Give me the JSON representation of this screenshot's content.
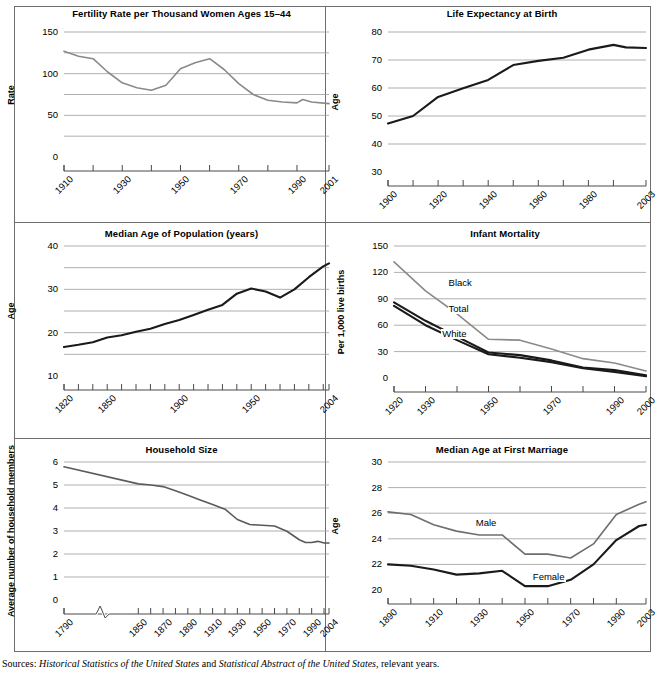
{
  "footer": {
    "prefix": "Sources: ",
    "source1": "Historical Statistics of the United States",
    "conjunction": " and ",
    "source2": "Statistical Abstract of the United States",
    "suffix": ", relevant years."
  },
  "colors": {
    "gray_line": "#8a8a8a",
    "black_line": "#1a1a1a",
    "gridline": "#9a9a9a",
    "axis": "#4a4a4a",
    "frame": "#6e6e6e",
    "text": "#000000",
    "background": "#ffffff"
  },
  "chart_data": [
    {
      "id": "fertility-rate",
      "type": "line",
      "title": "Fertility Rate per Thousand Women Ages 15–44",
      "xlabel": "",
      "ylabel": "Rate",
      "ylim": [
        0,
        150
      ],
      "yticks": [
        0,
        50,
        100,
        150
      ],
      "yticklabels": [
        "0",
        "50",
        "100",
        "150"
      ],
      "minor_gridlines": [
        25,
        75,
        125
      ],
      "grid": true,
      "xlim": [
        1910,
        2001
      ],
      "xticks": [
        1910,
        1920,
        1930,
        1940,
        1950,
        1960,
        1970,
        1980,
        1990,
        2001
      ],
      "xticklabels": [
        "1910",
        "",
        "1930",
        "",
        "1950",
        "",
        "1970",
        "",
        "1990",
        "2001"
      ],
      "legend": "none",
      "series": [
        {
          "name": "Fertility rate",
          "color": "#8a8a8a",
          "x": [
            1910,
            1915,
            1920,
            1925,
            1930,
            1935,
            1940,
            1945,
            1950,
            1955,
            1960,
            1965,
            1970,
            1975,
            1980,
            1985,
            1990,
            1992,
            1995,
            2001
          ],
          "values": [
            127,
            121,
            118,
            102,
            89,
            83,
            80,
            86,
            106,
            113,
            118,
            105,
            88,
            75,
            68,
            66,
            65,
            69,
            66,
            64
          ]
        }
      ]
    },
    {
      "id": "life-expectancy",
      "type": "line",
      "title": "Life Expectancy at Birth",
      "xlabel": "",
      "ylabel": "Age",
      "ylim": [
        30,
        80
      ],
      "yticks": [
        30,
        40,
        50,
        60,
        70,
        80
      ],
      "yticklabels": [
        "30",
        "40",
        "50",
        "60",
        "70",
        "80"
      ],
      "minor_gridlines": [],
      "grid": true,
      "xlim": [
        1900,
        2003
      ],
      "xticks": [
        1900,
        1910,
        1920,
        1930,
        1940,
        1950,
        1960,
        1970,
        1980,
        1990,
        2003
      ],
      "xticklabels": [
        "1900",
        "",
        "1920",
        "",
        "1940",
        "",
        "1960",
        "",
        "1980",
        "",
        "2003"
      ],
      "legend": "none",
      "series": [
        {
          "name": "Life expectancy",
          "color": "#1a1a1a",
          "x": [
            1900,
            1910,
            1920,
            1930,
            1940,
            1950,
            1960,
            1970,
            1980,
            1990,
            1995,
            2003
          ],
          "values": [
            47.3,
            50.0,
            56.8,
            59.9,
            62.9,
            68.2,
            69.7,
            70.8,
            73.7,
            75.4,
            74.5,
            74.3
          ]
        }
      ]
    },
    {
      "id": "median-age-population",
      "type": "line",
      "title": "Median Age of Population (years)",
      "xlabel": "",
      "ylabel": "Age",
      "ylim": [
        10,
        40
      ],
      "yticks": [
        10,
        20,
        30,
        40
      ],
      "yticklabels": [
        "10",
        "20",
        "30",
        "40"
      ],
      "minor_gridlines": [
        15,
        25,
        35
      ],
      "grid": true,
      "xlim": [
        1820,
        2004
      ],
      "xticks": [
        1820,
        1830,
        1840,
        1850,
        1860,
        1870,
        1880,
        1890,
        1900,
        1910,
        1920,
        1930,
        1940,
        1950,
        1960,
        1970,
        1980,
        1990,
        2000,
        2004
      ],
      "xticklabels": [
        "1820",
        "",
        "",
        "1850",
        "",
        "",
        "",
        "",
        "1900",
        "",
        "",
        "",
        "",
        "1950",
        "",
        "",
        "",
        "",
        "",
        "2004"
      ],
      "legend": "none",
      "series": [
        {
          "name": "Median age",
          "color": "#1a1a1a",
          "x": [
            1820,
            1830,
            1840,
            1850,
            1860,
            1870,
            1880,
            1890,
            1900,
            1910,
            1920,
            1930,
            1940,
            1950,
            1960,
            1970,
            1980,
            1990,
            2000,
            2004
          ],
          "values": [
            16.7,
            17.2,
            17.8,
            18.9,
            19.4,
            20.2,
            20.9,
            22.0,
            22.9,
            24.1,
            25.3,
            26.4,
            29.0,
            30.2,
            29.5,
            28.1,
            30.0,
            32.8,
            35.3,
            36.0
          ]
        }
      ]
    },
    {
      "id": "infant-mortality",
      "type": "line",
      "title": "Infant Mortality",
      "xlabel": "",
      "ylabel": "Per 1,000 live births",
      "ylim": [
        0,
        150
      ],
      "yticks": [
        0,
        30,
        60,
        90,
        120,
        150
      ],
      "yticklabels": [
        "0",
        "30",
        "60",
        "90",
        "120",
        "150"
      ],
      "minor_gridlines": [],
      "grid": true,
      "xlim": [
        1920,
        2000
      ],
      "xticks": [
        1920,
        1930,
        1940,
        1950,
        1960,
        1970,
        1980,
        1990,
        2000
      ],
      "xticklabels": [
        "1920",
        "1930",
        "",
        "1950",
        "",
        "1970",
        "",
        "1990",
        "2000"
      ],
      "legend": "inline",
      "series": [
        {
          "name": "Black",
          "label_x": 1937,
          "label_y": 108,
          "color": "#8a8a8a",
          "x": [
            1920,
            1930,
            1940,
            1950,
            1960,
            1970,
            1980,
            1990,
            2000
          ],
          "values": [
            132,
            99,
            73,
            44,
            43,
            33,
            22,
            17,
            8
          ]
        },
        {
          "name": "Total",
          "label_x": 1937,
          "label_y": 78,
          "color": "#1a1a1a",
          "x": [
            1920,
            1930,
            1940,
            1950,
            1960,
            1970,
            1980,
            1990,
            2000
          ],
          "values": [
            86,
            65,
            47,
            29,
            26,
            20,
            12,
            9,
            3
          ]
        },
        {
          "name": "White",
          "label_x": 1935,
          "label_y": 50,
          "color": "#1a1a1a",
          "x": [
            1920,
            1930,
            1940,
            1950,
            1960,
            1970,
            1980,
            1990,
            2000
          ],
          "values": [
            82,
            60,
            43,
            27,
            23,
            18,
            11,
            7,
            2
          ]
        }
      ]
    },
    {
      "id": "household-size",
      "type": "line",
      "title": "Household Size",
      "xlabel": "",
      "ylabel": "Average number of household members",
      "ylim": [
        0,
        6
      ],
      "yticks": [
        0,
        1,
        2,
        3,
        4,
        5,
        6
      ],
      "yticklabels": [
        "0",
        "1",
        "2",
        "3",
        "4",
        "5",
        "6"
      ],
      "minor_gridlines": [],
      "grid": true,
      "axis_break": true,
      "xlim": [
        1790,
        2004
      ],
      "xticks": [
        1790,
        1850,
        1860,
        1870,
        1880,
        1890,
        1900,
        1910,
        1920,
        1930,
        1940,
        1950,
        1960,
        1970,
        1980,
        1990,
        2000,
        2004
      ],
      "xticklabels": [
        "1790",
        "1850",
        "",
        "1870",
        "",
        "1890",
        "",
        "1910",
        "",
        "1930",
        "",
        "1950",
        "",
        "1970",
        "",
        "1990",
        "",
        "2004"
      ],
      "legend": "none",
      "series": [
        {
          "name": "Household size",
          "color": "#5a5a5a",
          "x": [
            1790,
            1850,
            1860,
            1870,
            1880,
            1890,
            1900,
            1910,
            1920,
            1930,
            1940,
            1950,
            1960,
            1970,
            1980,
            1985,
            1990,
            1995,
            2000,
            2004
          ],
          "values": [
            5.79,
            5.05,
            5.0,
            4.93,
            4.75,
            4.55,
            4.35,
            4.15,
            3.95,
            3.5,
            3.28,
            3.25,
            3.22,
            2.99,
            2.62,
            2.5,
            2.5,
            2.55,
            2.48,
            2.48
          ]
        }
      ]
    },
    {
      "id": "median-age-first-marriage",
      "type": "line",
      "title": "Median Age at First Marriage",
      "xlabel": "",
      "ylabel": "Age",
      "ylim": [
        20,
        30
      ],
      "yticks": [
        20,
        22,
        24,
        26,
        28,
        30
      ],
      "yticklabels": [
        "20",
        "22",
        "24",
        "26",
        "28",
        "30"
      ],
      "minor_gridlines": [],
      "grid": true,
      "xlim": [
        1890,
        2003
      ],
      "xticks": [
        1890,
        1900,
        1910,
        1920,
        1930,
        1940,
        1950,
        1960,
        1970,
        1980,
        1990,
        2003
      ],
      "xticklabels": [
        "1890",
        "",
        "1910",
        "",
        "1930",
        "",
        "1950",
        "",
        "1970",
        "",
        "1990",
        "2003"
      ],
      "legend": "inline",
      "series": [
        {
          "name": "Male",
          "label_x": 1928,
          "label_y": 25.2,
          "color": "#6e6e6e",
          "x": [
            1890,
            1900,
            1910,
            1920,
            1930,
            1940,
            1950,
            1960,
            1970,
            1980,
            1990,
            2000,
            2003
          ],
          "values": [
            26.1,
            25.9,
            25.1,
            24.6,
            24.3,
            24.3,
            22.8,
            22.8,
            22.5,
            23.6,
            25.9,
            26.7,
            26.9
          ]
        },
        {
          "name": "Female",
          "label_x": 1953,
          "label_y": 21.0,
          "color": "#1a1a1a",
          "x": [
            1890,
            1900,
            1910,
            1920,
            1930,
            1940,
            1950,
            1960,
            1970,
            1980,
            1990,
            2000,
            2003
          ],
          "values": [
            22.0,
            21.9,
            21.6,
            21.2,
            21.3,
            21.5,
            20.3,
            20.3,
            20.8,
            22.0,
            23.9,
            25.0,
            25.1
          ]
        }
      ]
    }
  ]
}
